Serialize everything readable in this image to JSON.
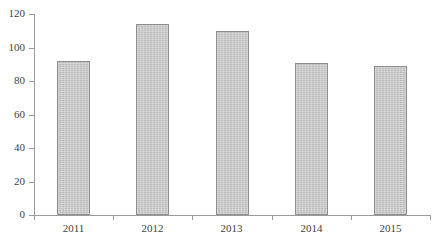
{
  "chart_data": {
    "type": "bar",
    "title": "",
    "subtitle": "",
    "xlabel": "",
    "ylabel": "",
    "categories": [
      "2011",
      "2012",
      "2013",
      "2014",
      "2015"
    ],
    "values": [
      92,
      114,
      110,
      91,
      89
    ],
    "series": [
      {
        "name": "",
        "values": [
          92,
          114,
          110,
          91,
          89
        ]
      }
    ],
    "ylim": [
      0,
      120
    ],
    "yticks": [
      0,
      20,
      40,
      60,
      80,
      100,
      120
    ],
    "ytick_labels": [
      "0",
      "20",
      "40",
      "60",
      "80",
      "100",
      "120"
    ],
    "xtick_labels": [
      "2011",
      "2012",
      "2013",
      "2014",
      "2015"
    ],
    "grid": false,
    "legend": null,
    "legend_position": "none",
    "annotations": [],
    "bar_fill_color": "#c9c9c9",
    "bar_edge_color": "#8e8e8e",
    "axis_color": "#9a9a9a",
    "text_color": "#3f3f3f",
    "background_color": "#ffffff"
  }
}
